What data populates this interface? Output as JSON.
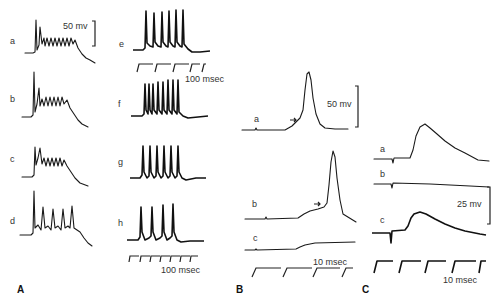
{
  "figure": {
    "panels": [
      {
        "id": "A",
        "label": "A",
        "traces": [
          {
            "label": "a",
            "pattern": "initial spikes followed by ~8 damped oscillations"
          },
          {
            "label": "b",
            "pattern": "initial spikes followed by ~6 oscillations"
          },
          {
            "label": "c",
            "pattern": "initial spike followed by ~5 oscillations"
          },
          {
            "label": "d",
            "pattern": "initial spike followed by 4 secondary spikes"
          }
        ],
        "voltage_scale": "50 mv"
      },
      {
        "id": "A2",
        "traces": [
          {
            "label": "e",
            "spikes": 6
          },
          {
            "label": "f",
            "spikes": 8
          },
          {
            "label": "g",
            "spikes": 6
          },
          {
            "label": "h",
            "spikes": 4
          }
        ],
        "time_scale_top": "100 msec",
        "time_scale_bottom": "100 msec"
      },
      {
        "id": "B",
        "label": "B",
        "traces": [
          {
            "label": "a",
            "pattern": "action potential with arrow at threshold"
          },
          {
            "label": "b",
            "pattern": "delayed action potential with arrow at threshold"
          },
          {
            "label": "c",
            "pattern": "subthreshold depolarization"
          }
        ],
        "voltage_scale": "50 mv",
        "time_scale": "10 msec"
      },
      {
        "id": "C",
        "label": "C",
        "traces": [
          {
            "label": "a",
            "pattern": "postsynaptic potential"
          },
          {
            "label": "b",
            "pattern": "flat, no response"
          },
          {
            "label": "c",
            "pattern": "postsynaptic potential"
          }
        ],
        "voltage_scale": "25 mv",
        "time_scale": "10 msec"
      }
    ]
  },
  "labels": {
    "A_a": "a",
    "A_b": "b",
    "A_c": "c",
    "A_d": "d",
    "A_e": "e",
    "A_f": "f",
    "A_g": "g",
    "A_h": "h",
    "B_a": "a",
    "B_b": "b",
    "B_c": "c",
    "C_a": "a",
    "C_b": "b",
    "C_c": "c",
    "panel_A": "A",
    "panel_B": "B",
    "panel_C": "C",
    "scale_A_mv": "50 mv",
    "scale_A_msec_top": "100 msec",
    "scale_A_msec_bottom": "100 msec",
    "scale_B_mv": "50 mv",
    "scale_B_msec": "10 msec",
    "scale_C_mv": "25 mv",
    "scale_C_msec": "10 msec"
  }
}
